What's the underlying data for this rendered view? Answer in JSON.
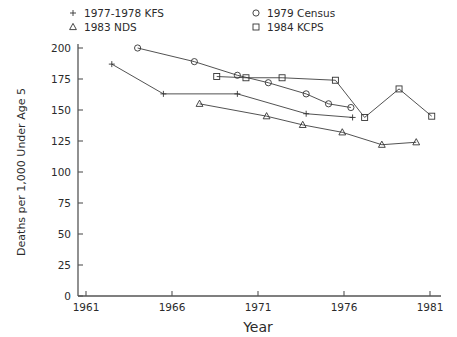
{
  "chart_data": {
    "type": "line",
    "title": "",
    "xlabel": "Year",
    "ylabel": "Deaths per 1,000 Under Age 5",
    "xlim": [
      1961,
      1981
    ],
    "ylim": [
      0,
      200
    ],
    "xticks": [
      1961,
      1966,
      1971,
      1976,
      1981
    ],
    "xtick_labels": [
      "1961",
      "1966",
      "1971",
      "1976",
      "1981"
    ],
    "yticks": [
      0,
      25,
      50,
      75,
      100,
      125,
      150,
      175,
      200
    ],
    "ytick_labels": [
      "0",
      "25",
      "50",
      "75",
      "100",
      "125",
      "150",
      "175",
      "200"
    ],
    "grid": false,
    "legend_position": "above-plot",
    "series": [
      {
        "name": "1977-1978 KFS",
        "marker": "plus",
        "points": [
          {
            "x": 1962.5,
            "y": 187
          },
          {
            "x": 1965.5,
            "y": 163
          },
          {
            "x": 1969.8,
            "y": 163
          },
          {
            "x": 1973.8,
            "y": 147
          },
          {
            "x": 1976.5,
            "y": 144
          }
        ]
      },
      {
        "name": "1983 NDS",
        "marker": "triangle",
        "points": [
          {
            "x": 1967.6,
            "y": 155
          },
          {
            "x": 1971.5,
            "y": 145
          },
          {
            "x": 1973.6,
            "y": 138
          },
          {
            "x": 1975.9,
            "y": 132
          },
          {
            "x": 1978.2,
            "y": 122
          },
          {
            "x": 1980.2,
            "y": 124
          }
        ]
      },
      {
        "name": "1979 Census",
        "marker": "circle",
        "points": [
          {
            "x": 1964.0,
            "y": 200
          },
          {
            "x": 1967.3,
            "y": 189
          },
          {
            "x": 1969.8,
            "y": 178
          },
          {
            "x": 1971.6,
            "y": 172
          },
          {
            "x": 1973.8,
            "y": 163
          },
          {
            "x": 1975.1,
            "y": 155
          },
          {
            "x": 1976.4,
            "y": 152
          }
        ]
      },
      {
        "name": "1984 KCPS",
        "marker": "square",
        "points": [
          {
            "x": 1968.6,
            "y": 177
          },
          {
            "x": 1970.3,
            "y": 176
          },
          {
            "x": 1972.4,
            "y": 176
          },
          {
            "x": 1975.5,
            "y": 174
          },
          {
            "x": 1977.2,
            "y": 144
          },
          {
            "x": 1979.2,
            "y": 167
          },
          {
            "x": 1981.1,
            "y": 145
          }
        ]
      }
    ],
    "legend": [
      {
        "label": "1977-1978 KFS",
        "marker": "plus"
      },
      {
        "label": "1983 NDS",
        "marker": "triangle"
      },
      {
        "label": "1979 Census",
        "marker": "circle"
      },
      {
        "label": "1984 KCPS",
        "marker": "square"
      }
    ],
    "colors": {
      "line": "#333333",
      "axis": "#555555",
      "text": "#2b2b2b",
      "background": "#ffffff"
    }
  }
}
